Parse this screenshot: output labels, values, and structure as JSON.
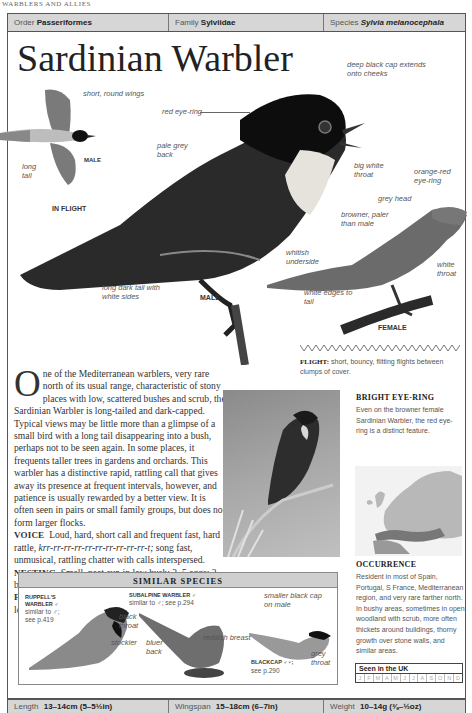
{
  "running_head": "WARBLERS AND ALLIES",
  "taxonomy": {
    "order_label": "Order",
    "order": "Passeriformes",
    "family_label": "Family",
    "family": "Sylviidae",
    "species_label": "Species",
    "species": "Sylvia melanocephala"
  },
  "title": "Sardinian Warbler",
  "illustration_labels": {
    "short_round_wings": "short, round wings",
    "long_tail": "long tail",
    "in_flight_male": "MALE",
    "in_flight": "IN FLIGHT",
    "red_eye_ring": "red eye-ring",
    "deep_black_cap": "deep black cap extends onto cheeks",
    "pale_grey_back": "pale grey back",
    "big_white_throat": "big white throat",
    "whitish_underside": "whitish underside",
    "long_dark_tail": "long dark tail with white sides",
    "male": "MALE",
    "orange_red_eye_ring": "orange-red eye-ring",
    "grey_head": "grey head",
    "browner_paler": "browner, paler than male",
    "white_throat": "white throat",
    "white_edges_tail": "white edges to tail",
    "female": "FEMALE"
  },
  "flight": {
    "label": "FLIGHT:",
    "text": "short, bouncy, flitting flights between clumps of cover."
  },
  "description": {
    "dropcap": "O",
    "text": "ne of the Mediterranean warblers, very rare north of its usual range, characteristic of stony places with low, scattered bushes and scrub, the Sardinian Warbler is long-tailed and dark-capped. Typical views may be little more than a glimpse of a small bird with a long tail disappearing into a bush, perhaps not to be seen again. In some places, it frequents taller trees in gardens and orchards. This warbler has a distinctive rapid, rattling call that gives away its presence at frequent intervals, however, and patience is usually rewarded by a better view. It is often seen in pairs or small family groups, but does not form larger flocks.",
    "voice_label": "VOICE",
    "voice_text_a": "Loud, hard, short call and frequent fast, hard rattle,",
    "voice_call": "krr-rr-rr-rr-rr-rr-rr-rr-rr-rr-t;",
    "voice_text_b": "song fast, unmusical, rattling chatter with calls interspersed.",
    "nesting_label": "NESTING",
    "nesting_text": "Small, neat cup in low bush; 3–5 eggs; 2 broods; April–July.",
    "feeding_label": "FEEDING",
    "feeding_text": "Takes small insects and spiders, mostly low in vegetation or on ground beneath."
  },
  "photo_caption": {
    "title": "BRIGHT EYE-RING",
    "text": "Even on the browner female Sardinian Warbler, the red eye-ring is a distinct feature."
  },
  "similar_species": {
    "heading": "SIMILAR SPECIES",
    "species": [
      {
        "name": "RUPPELL'S WARBLER ♂",
        "note": "similar to ♂; see p.419"
      },
      {
        "name": "SUBALPINE WARBLER ♂",
        "note": "similar to ♂; see p.294"
      },
      {
        "name": "BLACKCAP ♂♀;",
        "note": "see p.290"
      }
    ],
    "labels": {
      "black_throat": "black throat",
      "stockier": "stockier",
      "bluer_back": "bluer back",
      "reddish_breast": "reddish breast",
      "smaller_black_cap": "smaller black cap on male",
      "grey_throat": "grey throat"
    }
  },
  "occurrence": {
    "title": "OCCURRENCE",
    "text": "Resident in most of Spain, Portugal, S France, Mediterranean region, and very rare farther north. In bushy areas, sometimes in open woodland with scrub, more often thickets around buildings, thorny growth over stone walls, and similar areas."
  },
  "seen_in_uk": {
    "title": "Seen in the UK",
    "months": [
      "J",
      "F",
      "M",
      "A",
      "M",
      "J",
      "J",
      "A",
      "S",
      "O",
      "N",
      "D"
    ]
  },
  "stats": {
    "length_label": "Length",
    "length": "13–14cm (5–5½in)",
    "wingspan_label": "Wingspan",
    "wingspan": "15–18cm (6–7in)",
    "weight_label": "Weight",
    "weight": "10–14g (⅜–½oz)"
  }
}
